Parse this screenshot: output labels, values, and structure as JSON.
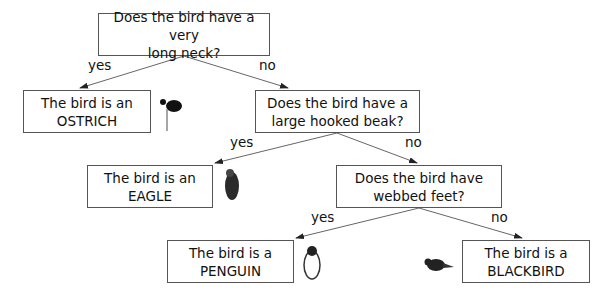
{
  "diagram": {
    "type": "decision-tree",
    "nodes": [
      {
        "id": "q1",
        "kind": "question",
        "line1": "Does the bird have a very",
        "line2": "long neck?"
      },
      {
        "id": "ostrich",
        "kind": "answer",
        "line1": "The bird is an",
        "line2": "OSTRICH",
        "icon": "ostrich-icon"
      },
      {
        "id": "q2",
        "kind": "question",
        "line1": "Does the bird have a",
        "line2": "large hooked beak?"
      },
      {
        "id": "eagle",
        "kind": "answer",
        "line1": "The bird is an",
        "line2": "EAGLE",
        "icon": "eagle-icon"
      },
      {
        "id": "q3",
        "kind": "question",
        "line1": "Does the bird have",
        "line2": "webbed feet?"
      },
      {
        "id": "penguin",
        "kind": "answer",
        "line1": "The bird is a",
        "line2": "PENGUIN",
        "icon": "penguin-icon"
      },
      {
        "id": "blackbird",
        "kind": "answer",
        "line1": "The bird is a",
        "line2": "BLACKBIRD",
        "icon": "blackbird-icon"
      }
    ],
    "edges": [
      {
        "from": "q1",
        "to": "ostrich",
        "label": "yes"
      },
      {
        "from": "q1",
        "to": "q2",
        "label": "no"
      },
      {
        "from": "q2",
        "to": "eagle",
        "label": "yes"
      },
      {
        "from": "q2",
        "to": "q3",
        "label": "no"
      },
      {
        "from": "q3",
        "to": "penguin",
        "label": "yes"
      },
      {
        "from": "q3",
        "to": "blackbird",
        "label": "no"
      }
    ]
  }
}
